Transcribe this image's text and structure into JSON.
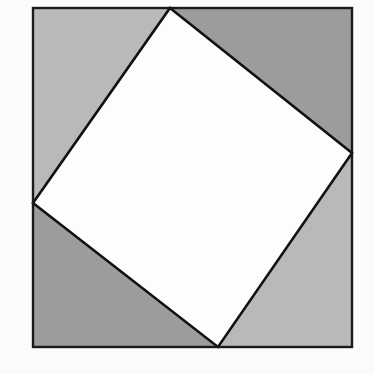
{
  "diagram": {
    "title": "",
    "outer_square": {
      "x1": 33,
      "y1": 8,
      "x2": 352,
      "y2": 347,
      "stroke": "#1a1a1a"
    },
    "inner_square": {
      "points": [
        [
          170,
          8
        ],
        [
          352,
          153
        ],
        [
          218,
          347
        ],
        [
          33,
          203
        ]
      ],
      "fill": "#fdfdfd",
      "stroke": "#111111"
    },
    "triangles": [
      {
        "name": "top-left",
        "points": [
          [
            33,
            8
          ],
          [
            170,
            8
          ],
          [
            33,
            203
          ]
        ],
        "fill": "#b9b9b9"
      },
      {
        "name": "top-right",
        "points": [
          [
            170,
            8
          ],
          [
            352,
            8
          ],
          [
            352,
            153
          ]
        ],
        "fill": "#9c9c9c"
      },
      {
        "name": "bottom-right",
        "points": [
          [
            352,
            153
          ],
          [
            352,
            347
          ],
          [
            218,
            347
          ]
        ],
        "fill": "#b9b9b9"
      },
      {
        "name": "bottom-left",
        "points": [
          [
            33,
            203
          ],
          [
            218,
            347
          ],
          [
            33,
            347
          ]
        ],
        "fill": "#9c9c9c"
      }
    ],
    "colors": {
      "light_gray": "#b9b9b9",
      "dark_gray": "#9c9c9c",
      "line": "#141414",
      "background": "#fbfbfb"
    }
  }
}
